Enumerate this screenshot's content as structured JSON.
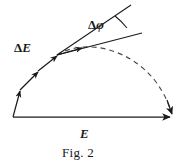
{
  "figure": {
    "caption": "Fig. 2",
    "labels": {
      "resultant_vector": "E",
      "increment_vector": "ΔE",
      "angle": "Δφ",
      "delta_symbol": "Δ",
      "e_symbol": "E",
      "phi_symbol": "φ"
    },
    "colors": {
      "ink": "#1a1a1a",
      "background": "#ffffff",
      "dashed_curve": "#555555"
    },
    "geometry": {
      "origin": {
        "x": 13,
        "y": 117
      },
      "resultant_tip": {
        "x": 172,
        "y": 117
      },
      "chain_vertices": [
        {
          "x": 13,
          "y": 117
        },
        {
          "x": 20,
          "y": 90
        },
        {
          "x": 38,
          "y": 71
        },
        {
          "x": 57,
          "y": 55
        },
        {
          "x": 80,
          "y": 48
        }
      ],
      "arc_start": {
        "x": 57,
        "y": 55
      },
      "arc_apex": {
        "x": 105,
        "y": 43
      },
      "arc_end": {
        "x": 172,
        "y": 114
      },
      "tangent_line_upper": {
        "x1": 57,
        "y1": 55,
        "x2": 131,
        "y2": 5
      },
      "tangent_line_lower": {
        "x1": 57,
        "y1": 55,
        "x2": 142,
        "y2": 33
      },
      "angle_arc_center": {
        "x": 57,
        "y": 55
      },
      "angle_arc_radius": 72
    }
  }
}
